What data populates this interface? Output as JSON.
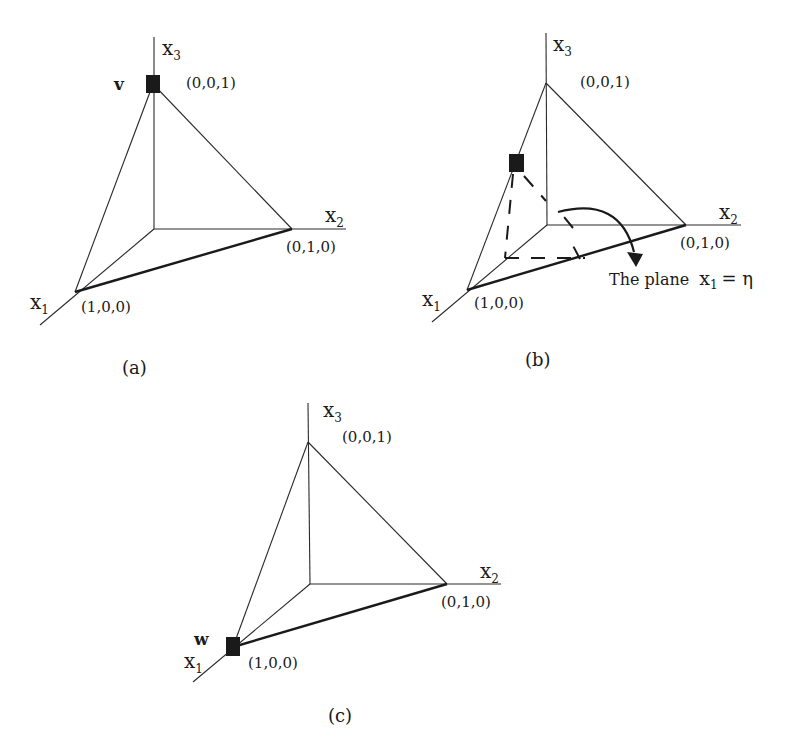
{
  "figure": {
    "panels": [
      {
        "id": "a",
        "caption": "(a)",
        "axes": {
          "x1": "x",
          "x1_sub": "1",
          "x2": "x",
          "x2_sub": "2",
          "x3": "x",
          "x3_sub": "3"
        },
        "vertices": {
          "e1": "(1,0,0)",
          "e2": "(0,1,0)",
          "e3": "(0,0,1)"
        },
        "marked_point": {
          "label": "v",
          "location": "(0,0,1)"
        }
      },
      {
        "id": "b",
        "caption": "(b)",
        "axes": {
          "x1": "x",
          "x1_sub": "1",
          "x2": "x",
          "x2_sub": "2",
          "x3": "x",
          "x3_sub": "3"
        },
        "vertices": {
          "e1": "(1,0,0)",
          "e2": "(0,1,0)",
          "e3": "(0,0,1)"
        },
        "marked_point": {
          "label": "",
          "location": "on edge from (0,0,1) to (1,0,0)"
        },
        "annotation": {
          "text": "The plane",
          "var": "x",
          "var_sub": "1",
          "rhs": "= η"
        }
      },
      {
        "id": "c",
        "caption": "(c)",
        "axes": {
          "x1": "x",
          "x1_sub": "1",
          "x2": "x",
          "x2_sub": "2",
          "x3": "x",
          "x3_sub": "3"
        },
        "vertices": {
          "e1": "(1,0,0)",
          "e2": "(0,1,0)",
          "e3": "(0,0,1)"
        },
        "marked_point": {
          "label": "w",
          "location": "(1,0,0)"
        }
      }
    ]
  }
}
